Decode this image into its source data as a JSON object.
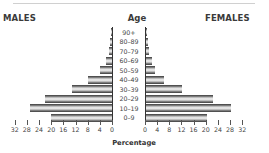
{
  "chart_data": {
    "type": "bar",
    "subtype": "population-pyramid",
    "title": "",
    "left_header": "MALES",
    "right_header": "FEMALES",
    "center_header": "Age",
    "xlabel": "Percentage",
    "ylabel": "Age",
    "categories": [
      "90+",
      "80–89",
      "70–79",
      "60–69",
      "50–59",
      "40–49",
      "30–39",
      "20–29",
      "10–19",
      "0–9"
    ],
    "series": [
      {
        "name": "MALES",
        "values": [
          0.3,
          0.5,
          1,
          2,
          4,
          8,
          13,
          22,
          27,
          20
        ]
      },
      {
        "name": "FEMALES",
        "values": [
          0.3,
          0.5,
          1,
          2,
          3,
          6,
          12,
          22,
          28,
          20
        ]
      }
    ],
    "xlim": [
      0,
      32
    ],
    "x_ticks": [
      32,
      28,
      24,
      20,
      16,
      12,
      8,
      4,
      0
    ],
    "x_tick_labels_left": [
      "32",
      "28",
      "24",
      "20",
      "16",
      "12",
      "8",
      "4",
      "0"
    ],
    "x_tick_labels_right": [
      "0",
      "4",
      "8",
      "12",
      "16",
      "20",
      "24",
      "28",
      "32"
    ],
    "grid": false,
    "legend": "none"
  },
  "headers": {
    "males": "MALES",
    "age": "Age",
    "females": "FEMALES"
  },
  "xlabel": "Percentage"
}
